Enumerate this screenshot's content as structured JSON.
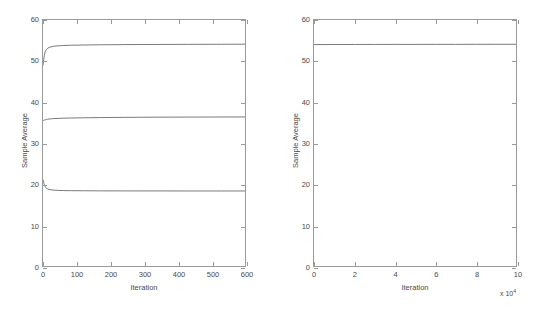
{
  "figure": {
    "background_color": "#ffffff",
    "axis_color": "#9a9a9a",
    "line_color": "#6b6b6b",
    "text_color": "#4a4a4a"
  },
  "chart_data": [
    {
      "type": "line",
      "panel": "left",
      "title": "",
      "xlabel": "Iteration",
      "ylabel": "Sample Average",
      "xlim": [
        0,
        600
      ],
      "ylim": [
        0,
        60
      ],
      "xticks": [
        0,
        100,
        200,
        300,
        400,
        500,
        600
      ],
      "xticklabels": [
        "0",
        "100",
        "200",
        "300",
        "400",
        "500",
        "600"
      ],
      "yticks": [
        0,
        10,
        20,
        30,
        40,
        50,
        60
      ],
      "yticklabels": [
        "0",
        "10",
        "20",
        "30",
        "40",
        "50",
        "60"
      ],
      "grid": false,
      "legend": null,
      "series": [
        {
          "name": "upper-chain",
          "x": [
            0,
            2,
            4,
            6,
            8,
            10,
            14,
            18,
            24,
            32,
            45,
            60,
            85,
            120,
            170,
            240,
            330,
            430,
            530,
            600
          ],
          "values": [
            48.9,
            50.3,
            51.4,
            52.1,
            52.5,
            52.8,
            53.1,
            53.3,
            53.45,
            53.6,
            53.7,
            53.78,
            53.85,
            53.9,
            53.95,
            54.0,
            54.03,
            54.06,
            54.08,
            54.1
          ]
        },
        {
          "name": "middle-chain",
          "x": [
            0,
            2,
            4,
            6,
            8,
            10,
            14,
            18,
            24,
            32,
            45,
            60,
            85,
            120,
            170,
            240,
            330,
            430,
            530,
            600
          ],
          "values": [
            35.4,
            35.5,
            35.6,
            35.65,
            35.7,
            35.75,
            35.8,
            35.85,
            35.9,
            35.95,
            36.0,
            36.05,
            36.1,
            36.15,
            36.2,
            36.25,
            36.3,
            36.32,
            36.34,
            36.35
          ]
        },
        {
          "name": "lower-chain",
          "x": [
            0,
            2,
            4,
            6,
            8,
            10,
            14,
            18,
            24,
            32,
            45,
            60,
            85,
            120,
            170,
            240,
            330,
            430,
            530,
            600
          ],
          "values": [
            21.1,
            20.4,
            19.8,
            19.4,
            19.15,
            19.0,
            18.8,
            18.68,
            18.58,
            18.5,
            18.44,
            18.4,
            18.37,
            18.35,
            18.33,
            18.32,
            18.31,
            18.3,
            18.3,
            18.3
          ]
        }
      ]
    },
    {
      "type": "line",
      "panel": "right",
      "title": "",
      "xlabel": "Iteration",
      "ylabel": "Sample Average",
      "x_exponent_label": "x 10",
      "x_exponent_power": "4",
      "xlim": [
        0,
        10
      ],
      "ylim": [
        0,
        60
      ],
      "xticks": [
        0,
        2,
        4,
        6,
        8,
        10
      ],
      "xticklabels": [
        "0",
        "2",
        "4",
        "6",
        "8",
        "10"
      ],
      "yticks": [
        0,
        10,
        20,
        30,
        40,
        50,
        60
      ],
      "yticklabels": [
        "0",
        "10",
        "20",
        "30",
        "40",
        "50",
        "60"
      ],
      "grid": false,
      "legend": null,
      "series": [
        {
          "name": "converged-chain",
          "x": [
            0,
            1,
            2,
            3,
            4,
            5,
            6,
            7,
            8,
            9,
            10
          ],
          "values": [
            54.0,
            54.02,
            54.03,
            54.04,
            54.05,
            54.05,
            54.06,
            54.06,
            54.07,
            54.07,
            54.08
          ]
        }
      ]
    }
  ]
}
